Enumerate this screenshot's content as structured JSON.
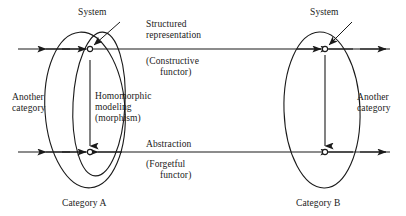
{
  "diagram": {
    "type": "category-theory-functor-diagram",
    "stroke_color": "#1a1a1a",
    "background_color": "#ffffff",
    "labels": {
      "system_left": "System",
      "system_right": "System",
      "structured_representation_line1": "Structured",
      "structured_representation_line2": "representation",
      "constructive_functor_line1": "(Constructive",
      "constructive_functor_line2": "functor)",
      "another_category_left_line1": "Another",
      "another_category_left_line2": "category",
      "another_category_right_line1": "Another",
      "another_category_right_line2": "category",
      "homomorphic_modeling_line1": "Homomorphic",
      "homomorphic_modeling_line2": "modeling",
      "homomorphic_modeling_line3": "(morphism)",
      "abstraction": "Abstraction",
      "forgetful_functor_line1": "(Forgetful",
      "forgetful_functor_line2": "functor)",
      "category_a": "Category A",
      "category_b": "Category B"
    },
    "nodes": [
      {
        "name": "object-a-top",
        "x": 90,
        "y": 49
      },
      {
        "name": "object-a-bottom",
        "x": 90,
        "y": 152
      },
      {
        "name": "object-b-top",
        "x": 325,
        "y": 49
      },
      {
        "name": "object-b-bottom",
        "x": 325,
        "y": 152
      }
    ],
    "horizontal_arrows": [
      {
        "name": "structured-representation-arrow",
        "y": 49,
        "x_start": 18,
        "x_end": 390
      },
      {
        "name": "abstraction-arrow",
        "y": 152,
        "x_start": 18,
        "x_end": 390
      }
    ],
    "ellipses": [
      {
        "name": "category-a-outer-ellipse",
        "cx": 85,
        "cy": 110,
        "rx": 40,
        "ry": 78
      },
      {
        "name": "category-a-inner-ellipse",
        "cx": 97,
        "cy": 105,
        "rx": 27,
        "ry": 72
      },
      {
        "name": "category-b-ellipse",
        "cx": 322,
        "cy": 110,
        "rx": 38,
        "ry": 78
      }
    ],
    "vertical_arrows": [
      {
        "name": "morphism-arrow-left",
        "x": 90,
        "y_start": 60,
        "y_end": 124
      },
      {
        "name": "morphism-arrow-right",
        "x": 325,
        "y_start": 55,
        "y_end": 146
      }
    ]
  }
}
